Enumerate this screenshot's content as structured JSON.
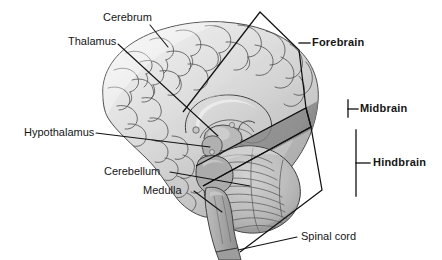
{
  "figure": {
    "background_color": "#ffffff",
    "ink_color": "#151515",
    "palette": {
      "cortex_light": "#e8e8e8",
      "cortex_mid": "#cfcfcf",
      "cortex_shadow": "#b4b4b4",
      "deep_structure": "#9d9d9d",
      "midbrain_band": "#8f8f8f",
      "cerebellum": "#b8b8b8",
      "brainstem": "#a8a8a8",
      "outline": "#2a2a2a"
    }
  },
  "labels": {
    "cerebrum": "Cerebrum",
    "thalamus": "Thalamus",
    "hypothalamus": "Hypothalamus",
    "cerebellum": "Cerebellum",
    "medulla": "Medulla",
    "spinal_cord": "Spinal cord",
    "forebrain": "Forebrain",
    "midbrain": "Midbrain",
    "hindbrain": "Hindbrain"
  },
  "structures": [
    {
      "name": "Cerebrum",
      "style": "plain",
      "leader": "line"
    },
    {
      "name": "Thalamus",
      "style": "plain",
      "leader": "line"
    },
    {
      "name": "Hypothalamus",
      "style": "plain",
      "leader": "line"
    },
    {
      "name": "Cerebellum",
      "style": "plain",
      "leader": "line"
    },
    {
      "name": "Medulla",
      "style": "plain",
      "leader": "line"
    },
    {
      "name": "Spinal cord",
      "style": "plain",
      "leader": "line"
    }
  ],
  "regions": [
    {
      "name": "Forebrain",
      "style": "bold",
      "leader": "polygon-bracket"
    },
    {
      "name": "Midbrain",
      "style": "bold",
      "leader": "polygon-bracket"
    },
    {
      "name": "Hindbrain",
      "style": "bold",
      "leader": "polygon-bracket"
    }
  ]
}
